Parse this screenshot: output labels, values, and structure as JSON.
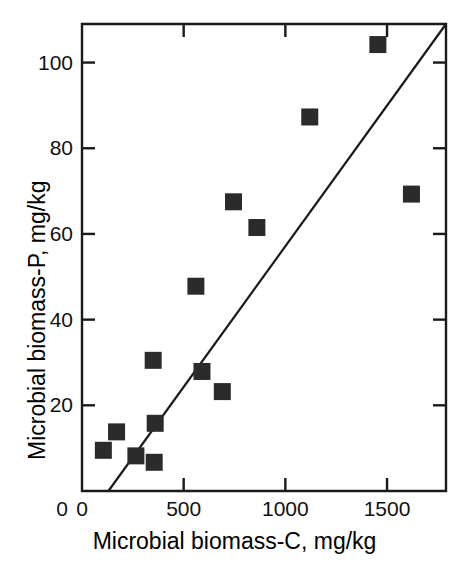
{
  "chart_data": {
    "type": "scatter",
    "title": "",
    "xlabel": "Microbial biomass-C, mg/kg",
    "ylabel": "Microbial biomass-P, mg/kg",
    "xlim": [
      0,
      1790
    ],
    "ylim": [
      0,
      109
    ],
    "xticks": [
      0,
      500,
      1000,
      1500
    ],
    "xtick_labels": [
      "0",
      "500",
      "1000",
      "1500"
    ],
    "yticks": [
      20,
      40,
      60,
      80,
      100
    ],
    "ytick_labels": [
      "20",
      "40",
      "60",
      "80",
      "100"
    ],
    "grid": false,
    "legend": false,
    "marker": "square",
    "marker_color": "#2b2b2b",
    "axis_color": "#1a1a1a",
    "points": [
      {
        "x": 105,
        "y": 9.5
      },
      {
        "x": 170,
        "y": 13.8
      },
      {
        "x": 265,
        "y": 8.2
      },
      {
        "x": 350,
        "y": 30.5
      },
      {
        "x": 355,
        "y": 6.7
      },
      {
        "x": 360,
        "y": 15.8
      },
      {
        "x": 560,
        "y": 47.8
      },
      {
        "x": 590,
        "y": 27.9
      },
      {
        "x": 690,
        "y": 23.2
      },
      {
        "x": 745,
        "y": 67.5
      },
      {
        "x": 860,
        "y": 61.5
      },
      {
        "x": 1120,
        "y": 87.3
      },
      {
        "x": 1455,
        "y": 104.2
      },
      {
        "x": 1620,
        "y": 69.3
      }
    ],
    "fit_line": {
      "name": "1:1 reference / regression line",
      "x_start": 130,
      "y_start": 0,
      "x_end": 1790,
      "y_end": 109
    }
  }
}
